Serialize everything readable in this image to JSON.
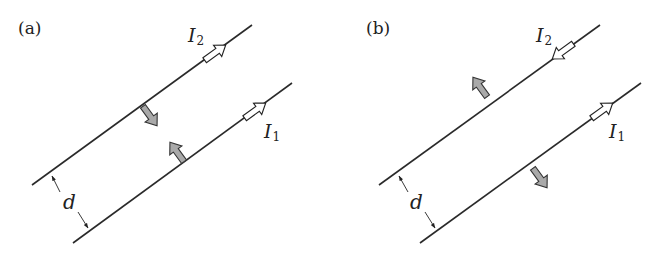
{
  "figure": {
    "panels": [
      {
        "label": "(a)",
        "wire_upper": {
          "current_label": "I",
          "current_sub": "2",
          "current_direction": "up-right"
        },
        "wire_lower": {
          "current_label": "I",
          "current_sub": "1",
          "current_direction": "up-right"
        },
        "forces": "attractive",
        "separation_label": "d"
      },
      {
        "label": "(b)",
        "wire_upper": {
          "current_label": "I",
          "current_sub": "2",
          "current_direction": "down-left"
        },
        "wire_lower": {
          "current_label": "I",
          "current_sub": "1",
          "current_direction": "up-right"
        },
        "forces": "repulsive",
        "separation_label": "d"
      }
    ],
    "colors": {
      "wire": "#2a2a2a",
      "current_arrow_fill": "#ffffff",
      "force_arrow_fill": "#a9a9a9",
      "background": "#ffffff"
    }
  }
}
